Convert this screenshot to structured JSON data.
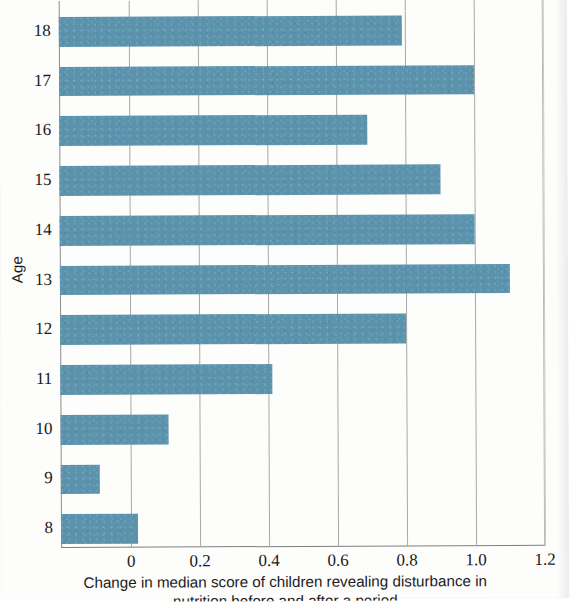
{
  "chart_data": {
    "type": "bar",
    "orientation": "horizontal",
    "title": "",
    "xlabel": "Change in median score of children revealing disturbance in",
    "xlabel_line2": "nutrition before and after a period",
    "ylabel": "Age",
    "categories": [
      "8",
      "9",
      "10",
      "11",
      "12",
      "13",
      "14",
      "15",
      "16",
      "17",
      "18"
    ],
    "values": [
      0.02,
      -0.09,
      0.11,
      0.41,
      0.8,
      1.1,
      1.0,
      0.9,
      0.69,
      1.0,
      0.79
    ],
    "xlim": [
      -0.203,
      1.2
    ],
    "ylim": [
      7.5,
      18.5
    ],
    "xticks": [
      "0",
      "0.2",
      "0.4",
      "0.6",
      "0.8",
      "1.0",
      "1.2"
    ],
    "xtick_values": [
      0,
      0.2,
      0.4,
      0.6,
      0.8,
      1.0,
      1.2
    ],
    "bar_color": "#5b93ad",
    "grid": "vertical",
    "legend": "none",
    "bar_start": -0.203
  },
  "axes": {
    "y_title": "Age",
    "x_tick_labels": [
      "0",
      "0.2",
      "0.4",
      "0.6",
      "0.8",
      "1.0",
      "1.2"
    ],
    "y_tick_labels": [
      "18",
      "17",
      "16",
      "15",
      "14",
      "13",
      "12",
      "11",
      "10",
      "9",
      "8"
    ]
  },
  "caption": {
    "line1": "Change in median score of children revealing disturbance in",
    "line2": "nutrition before and after a period"
  }
}
